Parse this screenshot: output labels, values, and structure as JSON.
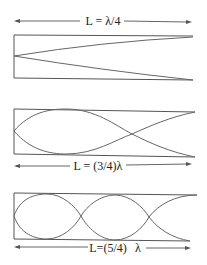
{
  "diagram": {
    "panels": [
      {
        "label": "L = λ/4",
        "length_fraction": "1/4",
        "nodes": 0,
        "label_position": "above"
      },
      {
        "label": "L = (3/4)λ",
        "length_fraction": "3/4",
        "nodes": 1,
        "label_position": "below"
      },
      {
        "label_main": "L=(5/4)",
        "label_suffix": "λ",
        "length_fraction": "5/4",
        "nodes": 2,
        "label_position": "below"
      }
    ],
    "colors": {
      "line": "#555555",
      "wave": "#666666",
      "text": "#222222",
      "background": "#ffffff"
    }
  }
}
